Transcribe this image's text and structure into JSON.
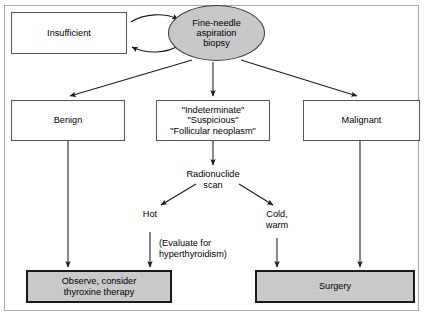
{
  "diagram": {
    "type": "clinical-flowchart",
    "title_visible": false,
    "colors": {
      "node_fill_gray": "#c9c9c9",
      "ellipse_fill_gray": "#c8c8c8",
      "node_fill_white": "#ffffff",
      "border_dark": "#1a1a1a",
      "border_thin": "#555555",
      "frame_border": "#a8a8a8",
      "text": "#000000",
      "arrow": "#1a1a1a"
    },
    "nodes": {
      "insufficient": {
        "label": "Insufficient",
        "shape": "rectangle",
        "fill": "white"
      },
      "fna": {
        "label": "Fine-needle\naspiration\nbiopsy",
        "shape": "ellipse",
        "fill": "gray"
      },
      "benign": {
        "label": "Benign",
        "shape": "rectangle",
        "fill": "white"
      },
      "indeterminate": {
        "label": "\"Indeterminate\"\n\"Suspicious\"\n\"Follicular neoplasm\"",
        "shape": "rectangle",
        "fill": "white"
      },
      "malignant": {
        "label": "Malignant",
        "shape": "rectangle",
        "fill": "white"
      },
      "observe": {
        "label": "Observe, consider\nthyroxine therapy",
        "shape": "rectangle",
        "fill": "gray"
      },
      "surgery": {
        "label": "Surgery",
        "shape": "rectangle",
        "fill": "gray"
      }
    },
    "free_labels": {
      "radionuclide_scan": "Radionuclide\nscan",
      "hot": "Hot",
      "cold_warm": "Cold,\nwarm",
      "evaluate_note": "(Evaluate for\nhyperthyroidism)"
    },
    "edges": [
      {
        "from": "insufficient",
        "to": "fna",
        "style": "curved",
        "label": ""
      },
      {
        "from": "fna",
        "to": "insufficient",
        "style": "curved",
        "label": ""
      },
      {
        "from": "fna",
        "to": "benign",
        "style": "straight",
        "label": ""
      },
      {
        "from": "fna",
        "to": "indeterminate",
        "style": "straight",
        "label": ""
      },
      {
        "from": "fna",
        "to": "malignant",
        "style": "straight",
        "label": ""
      },
      {
        "from": "benign",
        "to": "observe",
        "style": "straight",
        "label": ""
      },
      {
        "from": "indeterminate",
        "to": "radionuclide_scan",
        "style": "straight",
        "label": ""
      },
      {
        "from": "radionuclide_scan",
        "to": "hot",
        "style": "straight",
        "label": "Hot"
      },
      {
        "from": "radionuclide_scan",
        "to": "cold_warm",
        "style": "straight",
        "label": "Cold, warm"
      },
      {
        "from": "hot",
        "to": "observe",
        "style": "straight",
        "label": "(Evaluate for hyperthyroidism)"
      },
      {
        "from": "cold_warm",
        "to": "surgery",
        "style": "straight",
        "label": ""
      },
      {
        "from": "malignant",
        "to": "surgery",
        "style": "straight",
        "label": ""
      }
    ]
  }
}
